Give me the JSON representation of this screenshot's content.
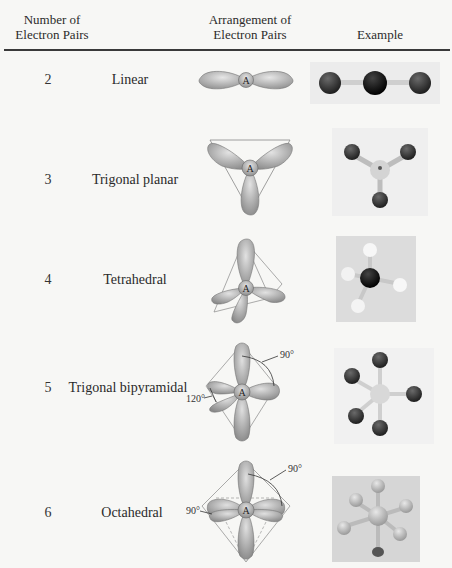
{
  "table": {
    "headers": {
      "col1_line1": "Number of",
      "col1_line2": "Electron Pairs",
      "col2_line1": "Arrangement of",
      "col2_line2": "Electron Pairs",
      "col3": "Example"
    },
    "rows": [
      {
        "pairs": "2",
        "arrangement": "Linear",
        "center_label": "A",
        "example": "linear molecule model"
      },
      {
        "pairs": "3",
        "arrangement": "Trigonal planar",
        "center_label": "A",
        "example": "trigonal planar molecule model"
      },
      {
        "pairs": "4",
        "arrangement": "Tetrahedral",
        "center_label": "A",
        "example": "tetrahedral molecule model"
      },
      {
        "pairs": "5",
        "arrangement": "Trigonal bipyramidal",
        "center_label": "A",
        "angle_axial": "90°",
        "angle_equatorial": "120°",
        "example": "trigonal bipyramidal molecule model"
      },
      {
        "pairs": "6",
        "arrangement": "Octahedral",
        "center_label": "A",
        "angle_axial": "90°",
        "angle_equatorial": "90°",
        "example": "octahedral molecule model"
      }
    ]
  },
  "colors": {
    "lobe": "#b4b4b4",
    "lobe_dark": "#8a8a8a",
    "atom_dark": "#3a3a3a",
    "atom_black": "#111111",
    "atom_white": "#f4f4f4",
    "photo_bg": "#e2e2e2"
  }
}
